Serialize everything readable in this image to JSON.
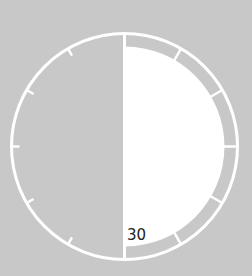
{
  "timer": {
    "minutes_label": "30",
    "elapsed_fraction": 0.5,
    "tick_count": 12
  },
  "colors": {
    "background": "#c8c8c8",
    "fill": "#ffffff",
    "ring": "#ffffff",
    "label": "#222222"
  },
  "icons": {
    "dial": "timer-dial-icon"
  }
}
